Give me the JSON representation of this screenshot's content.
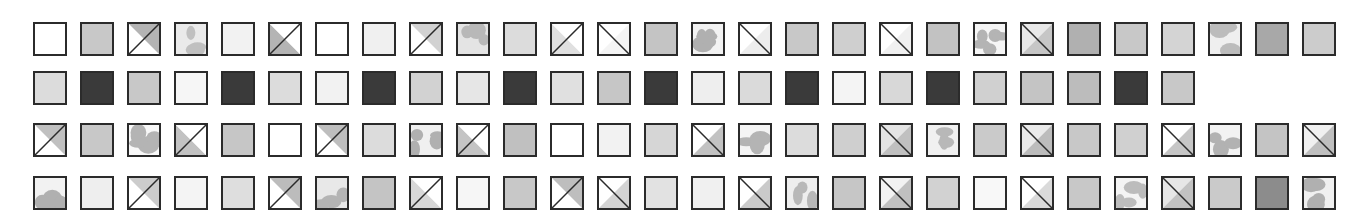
{
  "figure": {
    "type": "texture-swatch-grid",
    "background_color": "#ffffff",
    "border_color": "#2b2b2b",
    "border_width_px": 2,
    "tile_size_px": 34,
    "tile_pitch_x_px": 47,
    "row_tops_px": [
      22,
      71,
      123,
      176
    ],
    "first_tile_left_px": 33,
    "rows_count": 4,
    "pattern_kinds": [
      "solid",
      "diag-up",
      "diag-down",
      "blob"
    ],
    "palette": {
      "white": "#ffffff",
      "near_white": "#f6f6f6",
      "light": "#eaeaea",
      "light_gray": "#dcdcdc",
      "gray": "#c8c8c8",
      "mid_gray": "#b4b4b4",
      "dark_gray": "#8c8c8c",
      "darker_gray": "#6e6e6e",
      "near_black": "#3a3a3a",
      "black": "#2b2b2b"
    }
  },
  "chart_data": {
    "type": "heatmap",
    "xlabel": "",
    "ylabel": "",
    "grid": false,
    "legend": "none",
    "rows": [
      {
        "index": 1,
        "count": 28,
        "tiles": [
          {
            "kind": "solid",
            "fill": "#ffffff"
          },
          {
            "kind": "solid",
            "fill": "#c8c8c8"
          },
          {
            "kind": "diag-up",
            "fill_a": "#ffffff",
            "fill_b": "#b4b4b4"
          },
          {
            "kind": "blob",
            "base": "#eaeaea",
            "blob": "#c0c0c0"
          },
          {
            "kind": "solid",
            "fill": "#f2f2f2"
          },
          {
            "kind": "diag-up",
            "fill_a": "#b4b4b4",
            "fill_b": "#ffffff"
          },
          {
            "kind": "solid",
            "fill": "#ffffff"
          },
          {
            "kind": "solid",
            "fill": "#f0f0f0"
          },
          {
            "kind": "diag-up",
            "fill_a": "#ffffff",
            "fill_b": "#d2d2d2"
          },
          {
            "kind": "blob",
            "base": "#e4e4e4",
            "blob": "#b8b8b8"
          },
          {
            "kind": "solid",
            "fill": "#dcdcdc"
          },
          {
            "kind": "diag-up",
            "fill_a": "#e0e0e0",
            "fill_b": "#ffffff"
          },
          {
            "kind": "diag-down",
            "fill_a": "#ffffff",
            "fill_b": "#f4f4f4"
          },
          {
            "kind": "solid",
            "fill": "#c4c4c4"
          },
          {
            "kind": "blob",
            "base": "#f2f2f2",
            "blob": "#b0b0b0"
          },
          {
            "kind": "diag-down",
            "fill_a": "#ffffff",
            "fill_b": "#ededed"
          },
          {
            "kind": "solid",
            "fill": "#c8c8c8"
          },
          {
            "kind": "solid",
            "fill": "#cfcfcf"
          },
          {
            "kind": "diag-down",
            "fill_a": "#ffffff",
            "fill_b": "#f0f0f0"
          },
          {
            "kind": "solid",
            "fill": "#c2c2c2"
          },
          {
            "kind": "blob",
            "base": "#f6f6f6",
            "blob": "#b4b4b4"
          },
          {
            "kind": "diag-down",
            "fill_a": "#e8e8e8",
            "fill_b": "#c6c6c6"
          },
          {
            "kind": "solid",
            "fill": "#b0b0b0"
          },
          {
            "kind": "solid",
            "fill": "#c8c8c8"
          },
          {
            "kind": "solid",
            "fill": "#d4d4d4"
          },
          {
            "kind": "blob",
            "base": "#efefef",
            "blob": "#bcbcbc"
          },
          {
            "kind": "solid",
            "fill": "#a8a8a8"
          },
          {
            "kind": "solid",
            "fill": "#cccccc"
          }
        ]
      },
      {
        "index": 2,
        "count": 25,
        "tiles": [
          {
            "kind": "solid",
            "fill": "#dcdcdc"
          },
          {
            "kind": "solid",
            "fill": "#3a3a3a"
          },
          {
            "kind": "solid",
            "fill": "#c8c8c8"
          },
          {
            "kind": "solid",
            "fill": "#f6f6f6"
          },
          {
            "kind": "solid",
            "fill": "#3a3a3a"
          },
          {
            "kind": "solid",
            "fill": "#dcdcdc"
          },
          {
            "kind": "solid",
            "fill": "#f2f2f2"
          },
          {
            "kind": "solid",
            "fill": "#3a3a3a"
          },
          {
            "kind": "solid",
            "fill": "#d2d2d2"
          },
          {
            "kind": "solid",
            "fill": "#e6e6e6"
          },
          {
            "kind": "solid",
            "fill": "#3a3a3a"
          },
          {
            "kind": "solid",
            "fill": "#e0e0e0"
          },
          {
            "kind": "solid",
            "fill": "#c6c6c6"
          },
          {
            "kind": "solid",
            "fill": "#3a3a3a"
          },
          {
            "kind": "solid",
            "fill": "#eeeeee"
          },
          {
            "kind": "solid",
            "fill": "#dadada"
          },
          {
            "kind": "solid",
            "fill": "#3a3a3a"
          },
          {
            "kind": "solid",
            "fill": "#f4f4f4"
          },
          {
            "kind": "solid",
            "fill": "#d8d8d8"
          },
          {
            "kind": "solid",
            "fill": "#3a3a3a"
          },
          {
            "kind": "solid",
            "fill": "#d0d0d0"
          },
          {
            "kind": "solid",
            "fill": "#c4c4c4"
          },
          {
            "kind": "solid",
            "fill": "#bcbcbc"
          },
          {
            "kind": "solid",
            "fill": "#3a3a3a"
          },
          {
            "kind": "solid",
            "fill": "#c8c8c8"
          }
        ]
      },
      {
        "index": 3,
        "count": 28,
        "tiles": [
          {
            "kind": "diag-up",
            "fill_a": "#ffffff",
            "fill_b": "#c0c0c0"
          },
          {
            "kind": "solid",
            "fill": "#c8c8c8"
          },
          {
            "kind": "blob",
            "base": "#f8f8f8",
            "blob": "#b4b4b4"
          },
          {
            "kind": "diag-up",
            "fill_a": "#c2c2c2",
            "fill_b": "#ffffff"
          },
          {
            "kind": "solid",
            "fill": "#c6c6c6"
          },
          {
            "kind": "solid",
            "fill": "#ffffff"
          },
          {
            "kind": "diag-up",
            "fill_a": "#ffffff",
            "fill_b": "#bebebe"
          },
          {
            "kind": "solid",
            "fill": "#dcdcdc"
          },
          {
            "kind": "blob",
            "base": "#f0f0f0",
            "blob": "#b0b0b0"
          },
          {
            "kind": "diag-up",
            "fill_a": "#c4c4c4",
            "fill_b": "#ffffff"
          },
          {
            "kind": "solid",
            "fill": "#c0c0c0"
          },
          {
            "kind": "solid",
            "fill": "#ffffff"
          },
          {
            "kind": "solid",
            "fill": "#f2f2f2"
          },
          {
            "kind": "solid",
            "fill": "#d6d6d6"
          },
          {
            "kind": "diag-down",
            "fill_a": "#ffffff",
            "fill_b": "#c2c2c2"
          },
          {
            "kind": "blob",
            "base": "#f4f4f4",
            "blob": "#b4b4b4"
          },
          {
            "kind": "solid",
            "fill": "#dcdcdc"
          },
          {
            "kind": "solid",
            "fill": "#cfcfcf"
          },
          {
            "kind": "diag-down",
            "fill_a": "#e4e4e4",
            "fill_b": "#c0c0c0"
          },
          {
            "kind": "blob",
            "base": "#f0f0f0",
            "blob": "#b8b8b8"
          },
          {
            "kind": "solid",
            "fill": "#cacaca"
          },
          {
            "kind": "diag-down",
            "fill_a": "#eaeaea",
            "fill_b": "#bcbcbc"
          },
          {
            "kind": "solid",
            "fill": "#c8c8c8"
          },
          {
            "kind": "solid",
            "fill": "#d0d0d0"
          },
          {
            "kind": "diag-down",
            "fill_a": "#ffffff",
            "fill_b": "#c6c6c6"
          },
          {
            "kind": "blob",
            "base": "#f2f2f2",
            "blob": "#b2b2b2"
          },
          {
            "kind": "solid",
            "fill": "#c4c4c4"
          },
          {
            "kind": "diag-down",
            "fill_a": "#f0f0f0",
            "fill_b": "#bfbfbf"
          }
        ]
      },
      {
        "index": 4,
        "count": 28,
        "tiles": [
          {
            "kind": "blob",
            "base": "#f2f2f2",
            "blob": "#b0b0b0"
          },
          {
            "kind": "solid",
            "fill": "#eeeeee"
          },
          {
            "kind": "diag-up",
            "fill_a": "#ffffff",
            "fill_b": "#cccccc"
          },
          {
            "kind": "solid",
            "fill": "#f4f4f4"
          },
          {
            "kind": "solid",
            "fill": "#dedede"
          },
          {
            "kind": "diag-up",
            "fill_a": "#ffffff",
            "fill_b": "#bcbcbc"
          },
          {
            "kind": "blob",
            "base": "#e8e8e8",
            "blob": "#b4b4b4"
          },
          {
            "kind": "solid",
            "fill": "#c4c4c4"
          },
          {
            "kind": "diag-up",
            "fill_a": "#d8d8d8",
            "fill_b": "#ffffff"
          },
          {
            "kind": "solid",
            "fill": "#f6f6f6"
          },
          {
            "kind": "solid",
            "fill": "#c8c8c8"
          },
          {
            "kind": "diag-up",
            "fill_a": "#ffffff",
            "fill_b": "#bebebe"
          },
          {
            "kind": "diag-down",
            "fill_a": "#ffffff",
            "fill_b": "#d4d4d4"
          },
          {
            "kind": "solid",
            "fill": "#e2e2e2"
          },
          {
            "kind": "solid",
            "fill": "#f0f0f0"
          },
          {
            "kind": "diag-down",
            "fill_a": "#ffffff",
            "fill_b": "#cacaca"
          },
          {
            "kind": "blob",
            "base": "#eeeeee",
            "blob": "#b8b8b8"
          },
          {
            "kind": "solid",
            "fill": "#c6c6c6"
          },
          {
            "kind": "diag-down",
            "fill_a": "#f2f2f2",
            "fill_b": "#c0c0c0"
          },
          {
            "kind": "solid",
            "fill": "#d2d2d2"
          },
          {
            "kind": "solid",
            "fill": "#f8f8f8"
          },
          {
            "kind": "diag-down",
            "fill_a": "#ffffff",
            "fill_b": "#dadada"
          },
          {
            "kind": "solid",
            "fill": "#c8c8c8"
          },
          {
            "kind": "blob",
            "base": "#f4f4f4",
            "blob": "#bcbcbc"
          },
          {
            "kind": "diag-down",
            "fill_a": "#e6e6e6",
            "fill_b": "#c2c2c2"
          },
          {
            "kind": "solid",
            "fill": "#cacaca"
          },
          {
            "kind": "solid",
            "fill": "#8c8c8c"
          },
          {
            "kind": "blob",
            "base": "#f0f0f0",
            "blob": "#b0b0b0"
          }
        ]
      }
    ]
  }
}
